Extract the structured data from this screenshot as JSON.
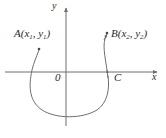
{
  "figure": {
    "background_color": "#ffffff",
    "line_color": "#6e6e6e",
    "text_color": "#2b2b2b"
  },
  "axes": {
    "x_axis_label": "x",
    "y_axis_label": "y",
    "origin_label": "0",
    "x_axis_y_position": 72,
    "y_axis_x_position": 66,
    "x_axis_start": 5,
    "x_axis_end": 160,
    "y_axis_top": 8,
    "y_axis_bottom": 126
  },
  "points": [
    {
      "id": "A",
      "letter": "A",
      "x_sub": "1",
      "y_sub": "1",
      "label": "A(x1, y1)",
      "label_left": 14,
      "label_top": 28,
      "marker_x": 39,
      "marker_y": 48
    },
    {
      "id": "B",
      "letter": "B",
      "x_sub": "2",
      "y_sub": "2",
      "label": "B(x2, y2)",
      "label_left": 111,
      "label_top": 28,
      "marker_x": 107,
      "marker_y": 33
    },
    {
      "id": "C",
      "letter": "C",
      "label": "C",
      "label_left": 114,
      "label_top": 72,
      "marker_x": 107,
      "marker_y": 70
    }
  ],
  "curve": {
    "description": "Open U-shaped curve dipping below the x-axis, beginning near A at upper left and ending with an arrow near B at upper right",
    "path": "M 39,50 C 36,58 34,62 32,70 C 28,88 30,102 42,110 C 56,119 82,119 97,110 C 108,103 110,88 107,72 C 105,56 103,46 106,36",
    "stroke_width": 1
  },
  "open_labels": {
    "x": "x",
    "y": "y",
    "origin": "0"
  }
}
